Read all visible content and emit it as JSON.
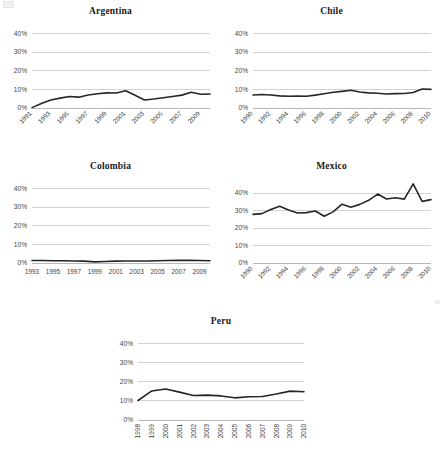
{
  "figure": {
    "panel_order": [
      "argentina",
      "chile",
      "colombia",
      "mexico",
      "peru"
    ],
    "y_axis_ticks": [
      "0%",
      "10%",
      "20%",
      "30%",
      "40%"
    ],
    "line_color": "#262626",
    "gridline_color": "#bfbfbf",
    "tick_label_color": "#3f3f3f"
  },
  "chart_data": [
    {
      "type": "line",
      "title": "Argentina",
      "xlabel": "",
      "ylabel": "",
      "ylim": [
        0,
        45
      ],
      "yticks": [
        0,
        10,
        20,
        30,
        40
      ],
      "ytick_labels": [
        "0%",
        "10%",
        "20%",
        "30%",
        "40%"
      ],
      "grid": true,
      "legend": "none",
      "xtick_rotation": 45,
      "xtick_labels": [
        "1991",
        "1993",
        "1995",
        "1997",
        "1999",
        "2001",
        "2003",
        "2005",
        "2007",
        "2009"
      ],
      "x": [
        1991,
        1992,
        1993,
        1994,
        1995,
        1996,
        1997,
        1998,
        1999,
        2000,
        2001,
        2002,
        2003,
        2004,
        2005,
        2006,
        2007,
        2008,
        2009,
        2010
      ],
      "values": [
        0.2,
        2.4,
        4.3,
        5.3,
        6.2,
        5.8,
        7.0,
        7.6,
        8.1,
        8.0,
        9.2,
        6.8,
        4.3,
        4.8,
        5.5,
        6.2,
        6.9,
        8.4,
        7.4,
        7.5
      ]
    },
    {
      "type": "line",
      "title": "Chile",
      "xlabel": "",
      "ylabel": "",
      "ylim": [
        0,
        45
      ],
      "yticks": [
        0,
        10,
        20,
        30,
        40
      ],
      "ytick_labels": [
        "0%",
        "10%",
        "20%",
        "30%",
        "40%"
      ],
      "grid": true,
      "legend": "none",
      "xtick_rotation": 45,
      "xtick_labels": [
        "1990",
        "1992",
        "1994",
        "1996",
        "1998",
        "2000",
        "2002",
        "2004",
        "2006",
        "2008",
        "2010"
      ],
      "x": [
        1990,
        1991,
        1992,
        1993,
        1994,
        1995,
        1996,
        1997,
        1998,
        1999,
        2000,
        2001,
        2002,
        2003,
        2004,
        2005,
        2006,
        2007,
        2008,
        2009,
        2010
      ],
      "values": [
        7.0,
        7.2,
        7.0,
        6.5,
        6.3,
        6.4,
        6.3,
        6.9,
        7.6,
        8.4,
        8.9,
        9.5,
        8.6,
        8.1,
        7.9,
        7.5,
        7.7,
        7.8,
        8.3,
        10.2,
        10.0
      ]
    },
    {
      "type": "line",
      "title": "Colombia",
      "xlabel": "",
      "ylabel": "",
      "ylim": [
        0,
        45
      ],
      "yticks": [
        0,
        10,
        20,
        30,
        40
      ],
      "ytick_labels": [
        "0%",
        "10%",
        "20%",
        "30%",
        "40%"
      ],
      "grid": true,
      "legend": "none",
      "xtick_rotation": 0,
      "xtick_labels": [
        "1993",
        "1995",
        "1997",
        "1999",
        "2001",
        "2003",
        "2005",
        "2007",
        "2009"
      ],
      "x": [
        1993,
        1994,
        1995,
        1996,
        1997,
        1998,
        1999,
        2000,
        2001,
        2002,
        2003,
        2004,
        2005,
        2006,
        2007,
        2008,
        2009,
        2010
      ],
      "values": [
        1.3,
        1.3,
        1.2,
        1.2,
        1.1,
        1.0,
        0.6,
        0.8,
        1.0,
        1.1,
        1.1,
        1.1,
        1.2,
        1.3,
        1.5,
        1.4,
        1.3,
        1.2
      ]
    },
    {
      "type": "line",
      "title": "Mexico",
      "xlabel": "",
      "ylabel": "",
      "ylim": [
        0,
        48
      ],
      "yticks": [
        0,
        10,
        20,
        30,
        40
      ],
      "ytick_labels": [
        "0%",
        "10%",
        "20%",
        "30%",
        "40%"
      ],
      "grid": true,
      "legend": "none",
      "xtick_rotation": 45,
      "xtick_labels": [
        "1990",
        "1992",
        "1994",
        "1996",
        "1998",
        "2000",
        "2002",
        "2004",
        "2006",
        "2008",
        "2010"
      ],
      "x": [
        1990,
        1991,
        1992,
        1993,
        1994,
        1995,
        1996,
        1997,
        1998,
        1999,
        2000,
        2001,
        2002,
        2003,
        2004,
        2005,
        2006,
        2007,
        2008,
        2009,
        2010
      ],
      "values": [
        27.8,
        28.2,
        30.6,
        32.4,
        30.3,
        28.6,
        28.8,
        29.7,
        26.7,
        29.2,
        33.6,
        31.8,
        33.5,
        35.8,
        39.4,
        36.6,
        37.3,
        36.5,
        45.2,
        35.2,
        36.2
      ]
    },
    {
      "type": "line",
      "title": "Peru",
      "xlabel": "",
      "ylabel": "",
      "ylim": [
        0,
        45
      ],
      "yticks": [
        0,
        10,
        20,
        30,
        40
      ],
      "ytick_labels": [
        "0%",
        "10%",
        "20%",
        "30%",
        "40%"
      ],
      "grid": true,
      "legend": "none",
      "xtick_rotation": 90,
      "xtick_labels": [
        "1998",
        "1999",
        "2000",
        "2001",
        "2002",
        "2003",
        "2004",
        "2005",
        "2006",
        "2007",
        "2008",
        "2009",
        "2010"
      ],
      "x": [
        1998,
        1999,
        2000,
        2001,
        2002,
        2003,
        2004,
        2005,
        2006,
        2007,
        2008,
        2009,
        2010
      ],
      "values": [
        10.2,
        15.2,
        16.2,
        14.6,
        12.8,
        13.0,
        12.6,
        11.6,
        12.2,
        12.3,
        13.6,
        15.1,
        14.8
      ]
    }
  ]
}
